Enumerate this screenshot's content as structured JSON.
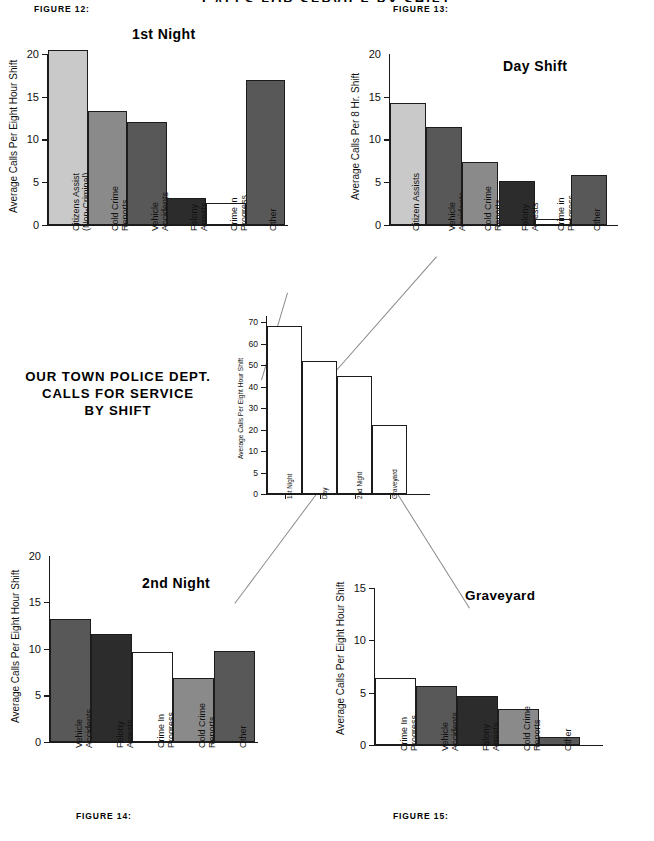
{
  "banner": {
    "text": "CALLS FOR SERVICE BY SHIFT"
  },
  "main_title": {
    "line1": "OUR TOWN POLICE DEPT.",
    "line2": "CALLS FOR SERVICE",
    "line3": "BY SHIFT"
  },
  "captions": {
    "fig12": "FIGURE 12:",
    "fig13": "FIGURE 13:",
    "fig14": "FIGURE 14:",
    "fig15": "FIGURE 15:"
  },
  "colors": {
    "light_gray": "#c9c9c9",
    "mid_gray": "#8a8a8a",
    "dark_gray": "#585858",
    "near_black": "#2c2c2c",
    "white": "#ffffff",
    "axis": "#1a1a1a",
    "connector": "#8a8a8a"
  },
  "chart_data": [
    {
      "id": "fig12",
      "type": "bar",
      "title": "1st Night",
      "caption": "FIGURE 12:",
      "xlabel": "",
      "ylabel": "Average Calls Per Eight Hour Shift",
      "ylim": [
        0,
        20.8
      ],
      "yticks": [
        0,
        5,
        10,
        15,
        20
      ],
      "grid": false,
      "categories": [
        "Citizens Assist (Non-Criminal)",
        "Cold Crime Reports",
        "Vehicle Accidents",
        "Felony Arrests",
        "Crime in Progress",
        "Other"
      ],
      "category_lines": [
        [
          "Citizens Assist",
          "(Non-Criminal)"
        ],
        [
          "Cold Crime",
          "Reports"
        ],
        [
          "Vehicle",
          "Accidents"
        ],
        [
          "Felony",
          "Arrests"
        ],
        [
          "Crime in",
          "Progress"
        ],
        [
          "Other",
          ""
        ]
      ],
      "values": [
        20.5,
        13.3,
        12.0,
        3.2,
        2.6,
        17.0
      ],
      "bar_colors": [
        "#c9c9c9",
        "#8a8a8a",
        "#585858",
        "#2c2c2c",
        "#ffffff",
        "#585858"
      ]
    },
    {
      "id": "fig13",
      "type": "bar",
      "title": "Day Shift",
      "caption": "FIGURE 13:",
      "xlabel": "",
      "ylabel": "Average Calls Per 8 Hr. Shift",
      "ylim": [
        0,
        20.8
      ],
      "yticks": [
        0,
        5,
        10,
        15,
        20
      ],
      "grid": false,
      "categories": [
        "Citizen Assists",
        "Vehicle Accidents",
        "Cold Crime Reports",
        "Felony Arrests",
        "Crime in Progress",
        "Other"
      ],
      "category_lines": [
        [
          "Citizen Assists",
          ""
        ],
        [
          "Vehicle",
          "Accidents"
        ],
        [
          "Cold Crime",
          "Reports"
        ],
        [
          "Felony",
          "Arrests"
        ],
        [
          "Crime in",
          "Progress"
        ],
        [
          "Other",
          ""
        ]
      ],
      "values": [
        14.2,
        11.5,
        7.4,
        5.2,
        0.7,
        5.8
      ],
      "bar_colors": [
        "#c9c9c9",
        "#585858",
        "#8a8a8a",
        "#2c2c2c",
        "#ffffff",
        "#585858"
      ]
    },
    {
      "id": "center",
      "type": "bar",
      "title": "",
      "caption": "",
      "xlabel": "",
      "ylabel": "Average Calls Per Eight Hour Shift",
      "ylim": [
        0,
        75
      ],
      "yticks": [
        0,
        5,
        10,
        20,
        30,
        40,
        50,
        60,
        70
      ],
      "grid": false,
      "categories": [
        "1st Night",
        "Day",
        "2nd Night",
        "Graveyard"
      ],
      "category_lines": [
        [
          "1st Night",
          ""
        ],
        [
          "Day",
          ""
        ],
        [
          "2nd Night",
          ""
        ],
        [
          "Graveyard",
          ""
        ]
      ],
      "values": [
        68,
        52,
        45,
        22
      ],
      "bar_colors": [
        "#ffffff",
        "#ffffff",
        "#ffffff",
        "#ffffff"
      ]
    },
    {
      "id": "fig14",
      "type": "bar",
      "title": "2nd Night",
      "caption": "FIGURE 14:",
      "xlabel": "",
      "ylabel": "Average Calls Per Eight Hour Shift",
      "ylim": [
        0,
        20.5
      ],
      "yticks": [
        0,
        5,
        10,
        15,
        20
      ],
      "grid": false,
      "categories": [
        "Vehicle Accidents",
        "Felony Arrests",
        "Crime In Progress",
        "Cold Crime Reports",
        "Other"
      ],
      "category_lines": [
        [
          "Vehicle",
          "Accidents"
        ],
        [
          "Felony",
          "Arrests"
        ],
        [
          "Crime In",
          "Progress"
        ],
        [
          "Cold Crime",
          "Reports"
        ],
        [
          "Other",
          ""
        ]
      ],
      "values": [
        13.2,
        11.6,
        9.7,
        6.9,
        9.8
      ],
      "bar_colors": [
        "#585858",
        "#2c2c2c",
        "#ffffff",
        "#8a8a8a",
        "#585858"
      ]
    },
    {
      "id": "fig15",
      "type": "bar",
      "title": "Graveyard",
      "caption": "FIGURE 15:",
      "xlabel": "",
      "ylabel": "Average Calls Per Eight Hour Shift",
      "ylim": [
        0,
        16.5
      ],
      "yticks": [
        0,
        5,
        10,
        15
      ],
      "grid": false,
      "categories": [
        "Crime In Progress",
        "Vehicle Accidents",
        "Felony Arrests",
        "Cold Crime Reports",
        "Other"
      ],
      "category_lines": [
        [
          "Crime In",
          "Progress"
        ],
        [
          "Vehicle",
          "Accidents"
        ],
        [
          "Felony",
          "Arrests"
        ],
        [
          "Cold Crime",
          "Reports"
        ],
        [
          "Other",
          ""
        ]
      ],
      "values": [
        6.4,
        5.6,
        4.7,
        3.4,
        0.8
      ],
      "bar_colors": [
        "#ffffff",
        "#585858",
        "#2c2c2c",
        "#8a8a8a",
        "#585858"
      ]
    }
  ],
  "connectors": [
    {
      "name": "center-to-fig12",
      "x1": 288,
      "y1": 293,
      "x2": 262,
      "y2": 380
    },
    {
      "name": "center-to-fig13",
      "x1": 437,
      "y1": 257,
      "x2": 296,
      "y2": 417
    },
    {
      "name": "center-to-fig14",
      "x1": 350,
      "y1": 450,
      "x2": 235,
      "y2": 604
    },
    {
      "name": "center-to-fig15",
      "x1": 383,
      "y1": 470,
      "x2": 470,
      "y2": 608
    }
  ]
}
